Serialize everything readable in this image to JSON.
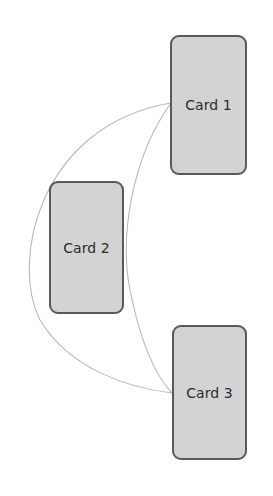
{
  "diagram": {
    "type": "card-graph",
    "background": "#ffffff",
    "card_fill": "#d3d3d3",
    "card_border": "#5a5a5a",
    "edge_color": "#b4b4b4",
    "cards": [
      {
        "id": "card-1",
        "label": "Card 1"
      },
      {
        "id": "card-2",
        "label": "Card 2"
      },
      {
        "id": "card-3",
        "label": "Card 3"
      }
    ],
    "edges": [
      {
        "from": "Card 1",
        "to": "Card 3",
        "style": "outer-arc"
      },
      {
        "from": "Card 1",
        "to": "Card 3",
        "style": "inner-arc"
      }
    ]
  }
}
